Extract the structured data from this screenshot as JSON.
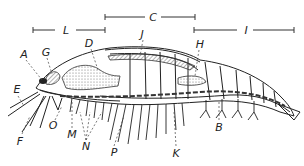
{
  "figure": {
    "brackets": [
      {
        "label": "L",
        "x1": 33,
        "x2": 105,
        "y": 30
      },
      {
        "label": "C",
        "x1": 105,
        "x2": 195,
        "y": 17
      },
      {
        "label": "I",
        "x1": 194,
        "x2": 294,
        "y": 30
      }
    ],
    "labels": [
      {
        "id": "A",
        "text": "A",
        "x": 24,
        "y": 54
      },
      {
        "id": "G",
        "text": "G",
        "x": 46,
        "y": 52
      },
      {
        "id": "D",
        "text": "D",
        "x": 89,
        "y": 43
      },
      {
        "id": "J",
        "text": "J",
        "x": 142,
        "y": 34
      },
      {
        "id": "H",
        "text": "H",
        "x": 200,
        "y": 44
      },
      {
        "id": "E",
        "text": "E",
        "x": 17,
        "y": 89
      },
      {
        "id": "F",
        "text": "F",
        "x": 20,
        "y": 141
      },
      {
        "id": "O",
        "text": "O",
        "x": 53,
        "y": 125
      },
      {
        "id": "M",
        "text": "M",
        "x": 72,
        "y": 134
      },
      {
        "id": "N",
        "text": "N",
        "x": 86,
        "y": 146
      },
      {
        "id": "P",
        "text": "P",
        "x": 114,
        "y": 152
      },
      {
        "id": "K",
        "text": "K",
        "x": 176,
        "y": 153
      },
      {
        "id": "B",
        "text": "B",
        "x": 219,
        "y": 127
      }
    ]
  }
}
